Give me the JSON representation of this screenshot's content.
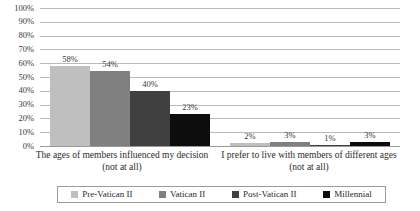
{
  "chart_data": {
    "type": "bar",
    "title": "",
    "subtitle": "",
    "xlabel": "",
    "ylabel": "",
    "ylim": [
      0,
      100
    ],
    "ytick_labels": [
      "100%",
      "90%",
      "80%",
      "70%",
      "60%",
      "50%",
      "40%",
      "30%",
      "20%",
      "10%",
      "0%"
    ],
    "ytick_values": [
      100,
      90,
      80,
      70,
      60,
      50,
      40,
      30,
      20,
      10,
      0
    ],
    "grid": true,
    "legend_position": "bottom",
    "value_suffix": "%",
    "categories": [
      "The ages of members influenced my decision (not at all)",
      "I prefer to live with members of different ages (not at all)"
    ],
    "series": [
      {
        "name": "Pre-Vatican II",
        "color": "#bfbfbf",
        "values": [
          58,
          2
        ],
        "labels": [
          "58%",
          "2%"
        ]
      },
      {
        "name": "Vatican II",
        "color": "#808080",
        "values": [
          54,
          3
        ],
        "labels": [
          "54%",
          "3%"
        ]
      },
      {
        "name": "Post-Vatican II",
        "color": "#404040",
        "values": [
          40,
          1
        ],
        "labels": [
          "40%",
          "1%"
        ]
      },
      {
        "name": "Millennial",
        "color": "#0d0d0d",
        "values": [
          23,
          3
        ],
        "labels": [
          "23%",
          "3%"
        ]
      }
    ]
  }
}
